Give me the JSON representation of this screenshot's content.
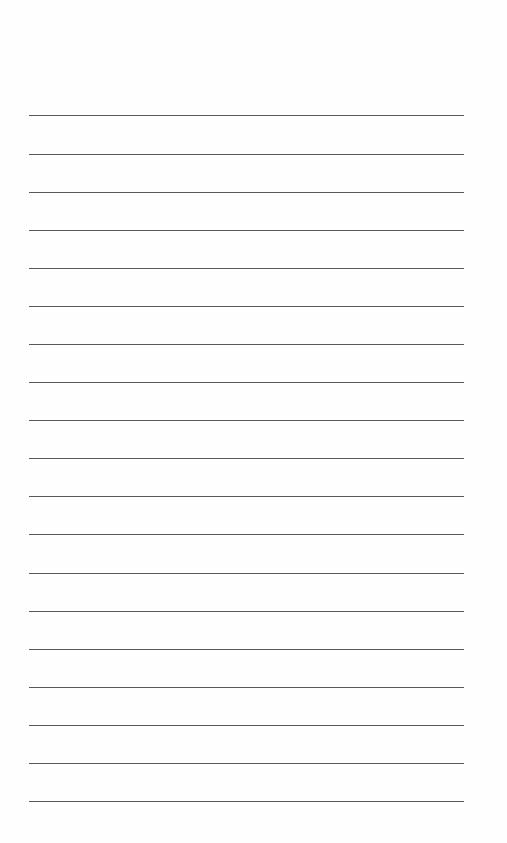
{
  "page": {
    "type": "lined-paper",
    "background_color": "#fefefe",
    "line_color": "#5a5a5a",
    "line_count": 19,
    "lines_y": [
      115,
      154,
      192,
      230,
      268,
      306,
      344,
      382,
      420,
      458,
      496,
      534,
      573,
      611,
      649,
      687,
      725,
      763,
      801
    ],
    "line_left": 29,
    "line_right": 464
  }
}
